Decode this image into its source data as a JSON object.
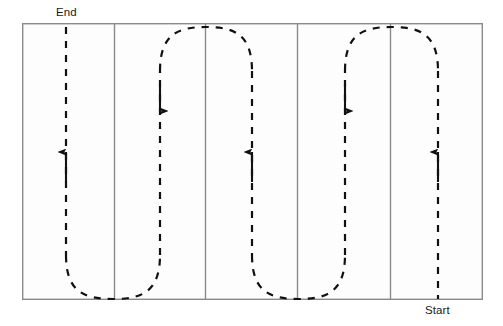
{
  "diagram": {
    "type": "coverage-path-plan",
    "title_visible": false,
    "canvas": {
      "width": 503,
      "height": 326,
      "background": "#ffffff"
    },
    "field": {
      "name": "field-boundary",
      "x": 22,
      "y": 23,
      "width": 461,
      "height": 277,
      "stroke": "#8a8a8a",
      "stroke_width": 1.4,
      "fill": "#fdfdfd"
    },
    "strip_dividers": {
      "name": "strip-dividers",
      "count": 4,
      "x_positions": [
        114,
        205,
        297,
        390
      ],
      "stroke": "#8a8a8a",
      "stroke_width": 1.4
    },
    "strips": {
      "count": 5,
      "boundaries_x": [
        22,
        114,
        205,
        297,
        390,
        483
      ]
    },
    "path": {
      "name": "serpentine-path",
      "style": "dashed",
      "stroke": "#111111",
      "stroke_width": 2.2,
      "dash_pattern": "7 7",
      "lane_x": [
        66,
        160,
        252,
        345,
        438
      ],
      "top_y": 27,
      "bottom_y": 299,
      "turns": [
        {
          "kind": "bottom-u-turn",
          "from_lane": 0,
          "to_lane": 1
        },
        {
          "kind": "top-u-turn",
          "from_lane": 1,
          "to_lane": 2
        },
        {
          "kind": "bottom-u-turn",
          "from_lane": 2,
          "to_lane": 3
        },
        {
          "kind": "top-u-turn",
          "from_lane": 3,
          "to_lane": 4
        }
      ]
    },
    "arrows": [
      {
        "name": "direction-arrow-lane-1",
        "lane": 0,
        "x": 66,
        "direction": "up",
        "tail_y": 182,
        "head_y": 144
      },
      {
        "name": "direction-arrow-lane-2",
        "lane": 1,
        "x": 160,
        "direction": "down",
        "tail_y": 84,
        "head_y": 119
      },
      {
        "name": "direction-arrow-lane-3",
        "lane": 2,
        "x": 252,
        "direction": "up",
        "tail_y": 182,
        "head_y": 144
      },
      {
        "name": "direction-arrow-lane-4",
        "lane": 3,
        "x": 345,
        "direction": "down",
        "tail_y": 84,
        "head_y": 119
      },
      {
        "name": "direction-arrow-lane-5",
        "lane": 4,
        "x": 438,
        "direction": "up",
        "tail_y": 182,
        "head_y": 144
      }
    ],
    "labels": {
      "end": "End",
      "start": "Start"
    }
  }
}
